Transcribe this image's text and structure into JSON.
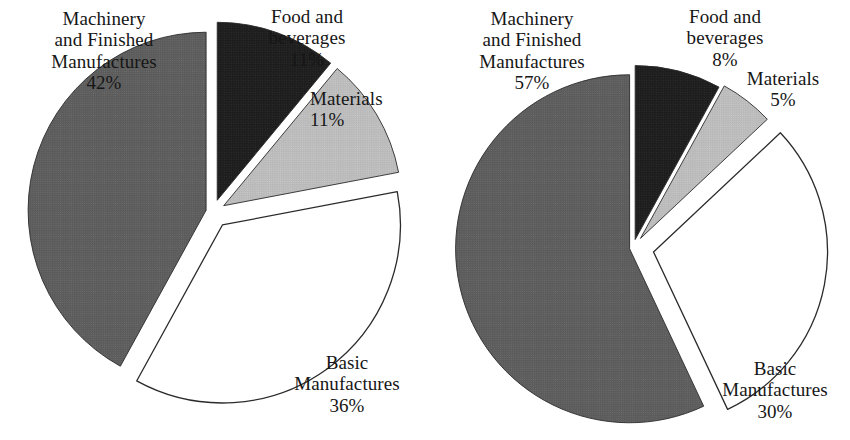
{
  "figure": {
    "background": "#ffffff",
    "width": 850,
    "height": 440
  },
  "palette": {
    "machinery": "#5a5a5a",
    "food": "#1c1c1c",
    "materials": "#b8b8b8",
    "basic": "#ffffff",
    "outline": "#2b2b2b",
    "text": "#161616"
  },
  "chart_data": [
    {
      "type": "pie",
      "name": "left-pie",
      "title": "",
      "exploded": true,
      "center": [
        213,
        212
      ],
      "radius": 178,
      "start_angle_deg": -90,
      "direction": "clockwise",
      "labels": [
        "Food and beverages",
        "Materials",
        "Basic Manufactures",
        "Machinery and Finished Manufactures"
      ],
      "values": [
        11,
        11,
        36,
        42
      ],
      "slices": [
        {
          "key": "food",
          "label_lines": [
            "Food and",
            "beverages"
          ],
          "value": 11,
          "value_text": "11%",
          "color": "#1c1c1c",
          "explode": 0.07
        },
        {
          "key": "materials",
          "label_lines": [
            "Materials"
          ],
          "value": 11,
          "value_text": "11%",
          "color": "#b8b8b8",
          "explode": 0.07
        },
        {
          "key": "basic",
          "label_lines": [
            "Basic",
            "Manufactures"
          ],
          "value": 36,
          "value_text": "36%",
          "color": "#ffffff",
          "explode": 0.09
        },
        {
          "key": "machinery",
          "label_lines": [
            "Machinery",
            "and Finished",
            "Manufactures"
          ],
          "value": 42,
          "value_text": "42%",
          "color": "#5a5a5a",
          "explode": 0.04
        }
      ]
    },
    {
      "type": "pie",
      "name": "right-pie",
      "title": "",
      "exploded": true,
      "center": [
        633,
        248
      ],
      "radius": 174,
      "start_angle_deg": -90,
      "direction": "clockwise",
      "labels": [
        "Food and beverages",
        "Materials",
        "Basic Manufactures",
        "Machinery and Finished Manufactures"
      ],
      "values": [
        8,
        5,
        30,
        57
      ],
      "slices": [
        {
          "key": "food",
          "label_lines": [
            "Food and",
            "beverages"
          ],
          "value": 8,
          "value_text": "8%",
          "color": "#1c1c1c",
          "explode": 0.05
        },
        {
          "key": "materials",
          "label_lines": [
            "Materials"
          ],
          "value": 5,
          "value_text": "5%",
          "color": "#b8b8b8",
          "explode": 0.07
        },
        {
          "key": "basic",
          "label_lines": [
            "Basic",
            "Manufactures"
          ],
          "value": 30,
          "value_text": "30%",
          "color": "#ffffff",
          "explode": 0.12
        },
        {
          "key": "machinery",
          "label_lines": [
            "Machinery",
            "and Finished",
            "Manufactures"
          ],
          "value": 57,
          "value_text": "57%",
          "color": "#5a5a5a",
          "explode": 0.02
        }
      ]
    }
  ],
  "labels": {
    "left": {
      "machinery": {
        "line1": "Machinery",
        "line2": "and Finished",
        "line3": "Manufactures",
        "pct": "42%"
      },
      "food": {
        "line1": "Food and",
        "line2": "beverages",
        "pct": "11%"
      },
      "materials": {
        "line1": "Materials",
        "pct": "11%"
      },
      "basic": {
        "line1": "Basic",
        "line2": "Manufactures",
        "pct": "36%"
      }
    },
    "right": {
      "machinery": {
        "line1": "Machinery",
        "line2": "and Finished",
        "line3": "Manufactures",
        "pct": "57%"
      },
      "food": {
        "line1": "Food and",
        "line2": "beverages",
        "pct": "8%"
      },
      "materials": {
        "line1": "Materials",
        "pct": "5%"
      },
      "basic": {
        "line1": "Basic",
        "line2": "Manufactures",
        "pct": "30%"
      }
    }
  }
}
